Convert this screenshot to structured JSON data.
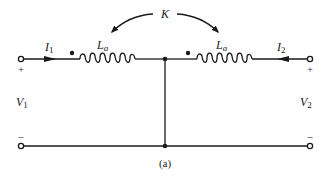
{
  "diagram": {
    "caption": "(a)",
    "coupling": {
      "label": "K"
    },
    "inductors": [
      {
        "label": "L",
        "subscript": "a",
        "side": "left"
      },
      {
        "label": "L",
        "subscript": "a",
        "side": "right"
      }
    ],
    "currents": [
      {
        "label": "I",
        "subscript": "1",
        "direction": "right"
      },
      {
        "label": "I",
        "subscript": "2",
        "direction": "left"
      }
    ],
    "voltages": [
      {
        "label": "V",
        "subscript": "1"
      },
      {
        "label": "V",
        "subscript": "2"
      }
    ],
    "polarity": {
      "plus": "+",
      "minus": "–"
    },
    "colors": {
      "ink": "#1a1a1a",
      "background": "#ffffff"
    }
  }
}
